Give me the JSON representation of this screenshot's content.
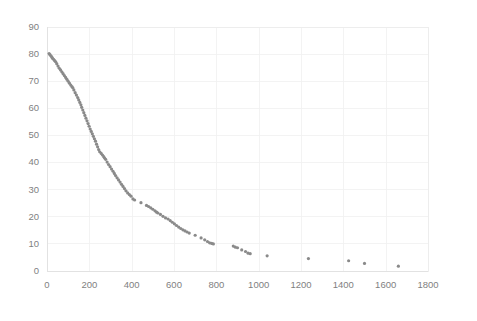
{
  "chart_data": {
    "type": "scatter",
    "title": "",
    "subtitle": "",
    "xlabel": "",
    "ylabel": "",
    "xlim": [
      0,
      1800
    ],
    "ylim": [
      0,
      90
    ],
    "xticks": [
      0,
      200,
      400,
      600,
      800,
      1000,
      1200,
      1400,
      1600,
      1800
    ],
    "yticks": [
      0,
      10,
      20,
      30,
      40,
      50,
      60,
      70,
      80,
      90
    ],
    "xtick_labels": [
      "0",
      "200",
      "400",
      "600",
      "800",
      "1000",
      "1200",
      "1400",
      "1600",
      "1800"
    ],
    "ytick_labels": [
      "0",
      "10",
      "20",
      "30",
      "40",
      "50",
      "60",
      "70",
      "80",
      "90"
    ],
    "grid": true,
    "grid_color": "#f0f0f0",
    "legend": null,
    "legend_position": "none",
    "marker_color": "#8a8a8a",
    "marker_size": 1.6,
    "background_color": "#ffffff",
    "series": [
      {
        "name": "series1",
        "points": [
          [
            10,
            80.0
          ],
          [
            14,
            79.6
          ],
          [
            18,
            79.2
          ],
          [
            22,
            78.8
          ],
          [
            26,
            78.3
          ],
          [
            31,
            77.9
          ],
          [
            36,
            77.4
          ],
          [
            41,
            77.0
          ],
          [
            46,
            76.3
          ],
          [
            52,
            75.4
          ],
          [
            58,
            74.6
          ],
          [
            64,
            74.0
          ],
          [
            70,
            73.3
          ],
          [
            76,
            72.6
          ],
          [
            82,
            71.9
          ],
          [
            88,
            71.2
          ],
          [
            94,
            70.5
          ],
          [
            100,
            69.8
          ],
          [
            106,
            69.1
          ],
          [
            112,
            68.4
          ],
          [
            118,
            67.8
          ],
          [
            122,
            67.4
          ],
          [
            127,
            66.6
          ],
          [
            133,
            65.6
          ],
          [
            139,
            64.7
          ],
          [
            145,
            63.8
          ],
          [
            150,
            62.9
          ],
          [
            155,
            62.0
          ],
          [
            160,
            61.1
          ],
          [
            164,
            60.2
          ],
          [
            169,
            59.2
          ],
          [
            174,
            58.2
          ],
          [
            179,
            57.2
          ],
          [
            184,
            56.2
          ],
          [
            189,
            55.2
          ],
          [
            194,
            54.2
          ],
          [
            199,
            53.2
          ],
          [
            204,
            52.2
          ],
          [
            209,
            51.3
          ],
          [
            214,
            50.4
          ],
          [
            219,
            49.5
          ],
          [
            224,
            48.6
          ],
          [
            229,
            47.7
          ],
          [
            234,
            46.6
          ],
          [
            239,
            45.6
          ],
          [
            244,
            44.6
          ],
          [
            249,
            43.8
          ],
          [
            256,
            43.2
          ],
          [
            262,
            42.6
          ],
          [
            268,
            42.0
          ],
          [
            272,
            41.5
          ],
          [
            277,
            41.0
          ],
          [
            284,
            40.0
          ],
          [
            291,
            39.1
          ],
          [
            298,
            38.3
          ],
          [
            305,
            37.4
          ],
          [
            312,
            36.6
          ],
          [
            318,
            35.8
          ],
          [
            324,
            35.0
          ],
          [
            331,
            34.2
          ],
          [
            338,
            33.4
          ],
          [
            345,
            32.6
          ],
          [
            352,
            31.8
          ],
          [
            359,
            31.0
          ],
          [
            366,
            30.2
          ],
          [
            373,
            29.4
          ],
          [
            381,
            28.6
          ],
          [
            389,
            28.0
          ],
          [
            397,
            27.4
          ],
          [
            406,
            26.4
          ],
          [
            414,
            26.0
          ],
          [
            444,
            25.0
          ],
          [
            470,
            24.0
          ],
          [
            480,
            23.6
          ],
          [
            490,
            23.1
          ],
          [
            500,
            22.6
          ],
          [
            510,
            22.0
          ],
          [
            518,
            21.5
          ],
          [
            524,
            21.2
          ],
          [
            536,
            20.7
          ],
          [
            548,
            20.0
          ],
          [
            560,
            19.4
          ],
          [
            572,
            19.0
          ],
          [
            582,
            18.4
          ],
          [
            592,
            17.8
          ],
          [
            602,
            17.2
          ],
          [
            612,
            16.6
          ],
          [
            622,
            16.0
          ],
          [
            632,
            15.5
          ],
          [
            642,
            15.0
          ],
          [
            652,
            14.6
          ],
          [
            662,
            14.2
          ],
          [
            672,
            13.8
          ],
          [
            700,
            13.0
          ],
          [
            728,
            12.0
          ],
          [
            745,
            11.3
          ],
          [
            758,
            10.7
          ],
          [
            768,
            10.2
          ],
          [
            778,
            10.0
          ],
          [
            786,
            9.8
          ],
          [
            880,
            9.0
          ],
          [
            890,
            8.6
          ],
          [
            900,
            8.4
          ],
          [
            920,
            7.6
          ],
          [
            938,
            7.0
          ],
          [
            950,
            6.4
          ],
          [
            960,
            6.2
          ],
          [
            1040,
            5.4
          ],
          [
            1235,
            4.4
          ],
          [
            1425,
            3.6
          ],
          [
            1500,
            2.6
          ],
          [
            1660,
            1.6
          ]
        ]
      }
    ]
  }
}
